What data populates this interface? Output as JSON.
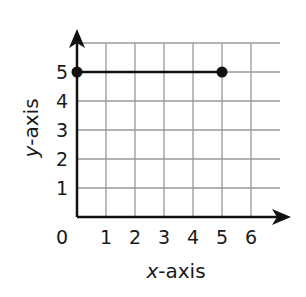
{
  "chart_data": {
    "type": "line",
    "title": "",
    "xlabel_var": "x",
    "xlabel_rest": "-axis",
    "ylabel_var": "y",
    "ylabel_rest": "-axis",
    "xlim": [
      0,
      7
    ],
    "ylim": [
      0,
      6
    ],
    "grid": true,
    "x_ticks": [
      "0",
      "1",
      "2",
      "3",
      "4",
      "5",
      "6"
    ],
    "y_ticks": [
      "1",
      "2",
      "3",
      "4",
      "5"
    ],
    "series": [
      {
        "name": "segment",
        "points": [
          [
            0,
            5
          ],
          [
            5,
            5
          ]
        ],
        "endpoints": "closed-dots"
      }
    ],
    "colors": {
      "line": "#111111",
      "grid": "#9a9a9a",
      "axis": "#111111"
    }
  }
}
